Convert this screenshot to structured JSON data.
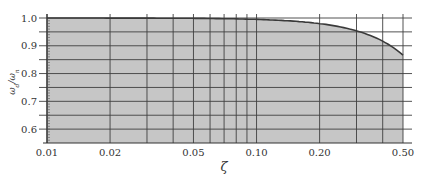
{
  "chart_data": {
    "type": "area",
    "title": "",
    "xlabel": "ζ",
    "ylabel": "ω_d/ω_n",
    "xscale": "log",
    "xlim": [
      0.01,
      0.5
    ],
    "ylim": [
      0.55,
      1.0
    ],
    "grid": true,
    "legend": null,
    "x_tick_labels": [
      "0.01",
      "0.02",
      "0.05",
      "0.10",
      "0.20",
      "0.50"
    ],
    "x_ticks": [
      0.01,
      0.02,
      0.05,
      0.1,
      0.2,
      0.5
    ],
    "x_gridlines": [
      0.01,
      0.02,
      0.03,
      0.04,
      0.05,
      0.06,
      0.07,
      0.08,
      0.09,
      0.1,
      0.2,
      0.3,
      0.4,
      0.5
    ],
    "y_tick_labels": [
      "0.6",
      "0.7",
      "0.8",
      "0.9",
      "1.0"
    ],
    "y_ticks": [
      0.6,
      0.7,
      0.8,
      0.9,
      1.0
    ],
    "y_gridlines": [
      0.6,
      0.65,
      0.7,
      0.75,
      0.8,
      0.85,
      0.9,
      0.95,
      1.0
    ],
    "series": [
      {
        "name": "ω_d/ω_n = sqrt(1 − ζ²)",
        "x": [
          0.01,
          0.02,
          0.05,
          0.1,
          0.15,
          0.2,
          0.25,
          0.3,
          0.35,
          0.4,
          0.45,
          0.5
        ],
        "values": [
          1.0,
          1.0,
          0.999,
          0.995,
          0.989,
          0.98,
          0.968,
          0.954,
          0.937,
          0.917,
          0.893,
          0.866
        ]
      }
    ],
    "colors": {
      "fill": "#c6c6c6",
      "line": "#3a3a3a",
      "grid": "#3f3f3f",
      "background": "#ffffff"
    }
  }
}
